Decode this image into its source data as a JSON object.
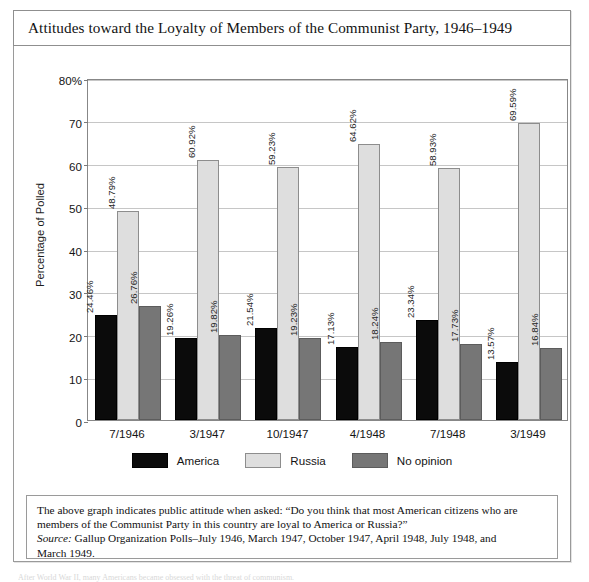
{
  "figure": {
    "title": "Attitudes toward the Loyalty of Members of the Communist Party, 1946–1949"
  },
  "chart_data": {
    "type": "bar",
    "title": "Attitudes toward the Loyalty of Members of the Communist Party, 1946–1949",
    "xlabel": "",
    "ylabel": "Percentage of Polled",
    "ylim": [
      0,
      80
    ],
    "yticks": [
      0,
      10,
      20,
      30,
      40,
      50,
      60,
      70,
      80
    ],
    "ytick_labels": [
      "0",
      "10",
      "20",
      "30",
      "40",
      "50",
      "60",
      "70",
      "80%"
    ],
    "grid": true,
    "legend_position": "bottom-center",
    "categories": [
      "7/1946",
      "3/1947",
      "10/1947",
      "4/1948",
      "7/1948",
      "3/1949"
    ],
    "series": [
      {
        "name": "America",
        "color": "#0b0b0b",
        "values": [
          24.46,
          19.26,
          21.54,
          17.13,
          23.34,
          13.57
        ],
        "labels": [
          "24.46%",
          "19.26%",
          "21.54%",
          "17.13%",
          "23.34%",
          "13.57%"
        ]
      },
      {
        "name": "Russia",
        "color": "#dedede",
        "values": [
          48.79,
          60.92,
          59.23,
          64.62,
          58.93,
          69.59
        ],
        "labels": [
          "48.79%",
          "60.92%",
          "59.23%",
          "64.62%",
          "58.93%",
          "69.59%"
        ]
      },
      {
        "name": "No opinion",
        "color": "#767676",
        "values": [
          26.76,
          19.82,
          19.23,
          18.24,
          17.73,
          16.84
        ],
        "labels": [
          "26.76%",
          "19.82%",
          "19.23%",
          "18.24%",
          "17.73%",
          "16.84%"
        ]
      }
    ]
  },
  "caption": {
    "line1": "The above graph indicates public attitude when asked: “Do you think that most American citizens who are",
    "line2": "members of the Communist Party in this country are loyal to America or Russia?”",
    "source_label": "Source:",
    "source_line1": " Gallup Organization Polls–July 1946, March 1947, October 1947, April 1948, July 1948, and",
    "source_line2": "March 1949."
  },
  "bottom_cut_text": "After World War II, many Americans became obsessed with the threat of communism."
}
